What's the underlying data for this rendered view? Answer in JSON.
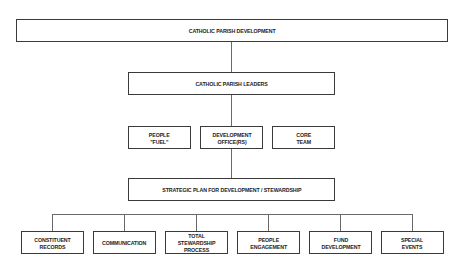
{
  "diagram": {
    "title_box": "CATHOLIC PARISH DEVELOPMENT",
    "leaders_box": "CATHOLIC PARISH LEADERS",
    "middle_boxes": [
      {
        "label": "PEOPLE\n\"FUEL\""
      },
      {
        "label": "DEVELOPMENT\nOFFICE(RS)"
      },
      {
        "label": "CORE\nTEAM"
      }
    ],
    "strategic_box": "STRATEGIC PLAN FOR DEVELOPMENT / STEWARDSHIP",
    "bottom_boxes": [
      {
        "label": "CONSTITUENT\nRECORDS"
      },
      {
        "label": "COMMUNICATION"
      },
      {
        "label": "TOTAL STEWARDSHIP\nPROCESS"
      },
      {
        "label": "PEOPLE\nENGAGEMENT"
      },
      {
        "label": "FUND\nDEVELOPMENT"
      },
      {
        "label": "SPECIAL\nEVENTS"
      }
    ],
    "colors": {
      "border": "#3a3a3a",
      "connector": "#6a6a6a",
      "text": "#222222",
      "background": "#ffffff"
    }
  }
}
